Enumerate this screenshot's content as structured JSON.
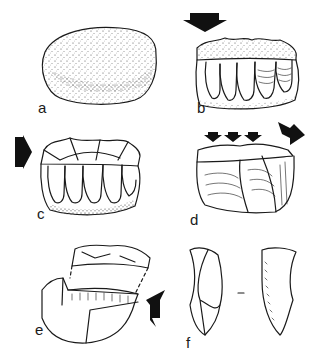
{
  "figure": {
    "panels": [
      {
        "id": "a",
        "label": "a",
        "subject": "unworked nodule / cobble"
      },
      {
        "id": "b",
        "label": "b",
        "subject": "core with blade removals, arrow indicating striking direction from top"
      },
      {
        "id": "c",
        "label": "c",
        "subject": "core with faceted platform, arrow from left"
      },
      {
        "id": "d",
        "label": "d",
        "subject": "core with platform preparation, three small arrows and one large arrow"
      },
      {
        "id": "e",
        "label": "e",
        "subject": "core tablet removal, arrow from right"
      },
      {
        "id": "f",
        "label": "f",
        "subject": "core tablet / crested blade in two views",
        "separator": "-"
      }
    ]
  },
  "colors": {
    "ink": "#1a1a1a",
    "background": "#ffffff"
  }
}
